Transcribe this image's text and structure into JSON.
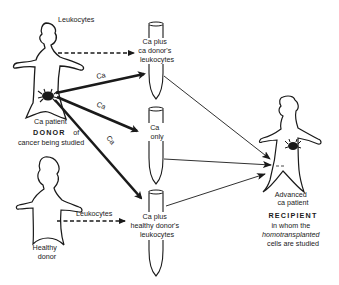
{
  "colors": {
    "ink": "#1a1a1a",
    "background": "#ffffff"
  },
  "donor_cancer": {
    "arrow_label": "Leukocytes",
    "patient_label": "Ca patient",
    "role_title": "DONOR",
    "role_suffix": "of",
    "role_desc": "cancer being studied",
    "icon": "crab-icon"
  },
  "ca_arrows": [
    "Ca",
    "Ca",
    "Ca"
  ],
  "tubes": [
    {
      "lines": [
        "Ca plus",
        "ca donor's",
        "leukocytes"
      ]
    },
    {
      "lines": [
        "Ca",
        "only"
      ]
    },
    {
      "lines": [
        "Ca plus",
        "healthy donor's",
        "leukocytes"
      ]
    }
  ],
  "donor_healthy": {
    "arrow_label": "Leukocytes",
    "lines": [
      "Healthy",
      "donor"
    ]
  },
  "recipient": {
    "patient_lines": [
      "Advanced",
      "ca patient"
    ],
    "role_title": "RECIPIENT",
    "role_desc": [
      "in whom the",
      "homotransplanted",
      "cells are studied"
    ],
    "icon": "crab-icon"
  }
}
